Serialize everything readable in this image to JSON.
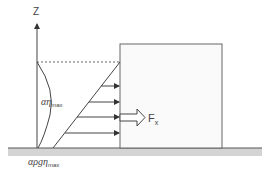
{
  "diagram": {
    "axis_label": "Z",
    "wave_height_label": "αη",
    "wave_height_sub": "max",
    "pressure_label": "αρgη",
    "pressure_sub": "max",
    "force_label": "F",
    "force_sub": "x",
    "colors": {
      "line": "#444444",
      "ground": "#d4d4d4",
      "block_fill": "#fafafa",
      "block_stroke": "#666666"
    }
  }
}
